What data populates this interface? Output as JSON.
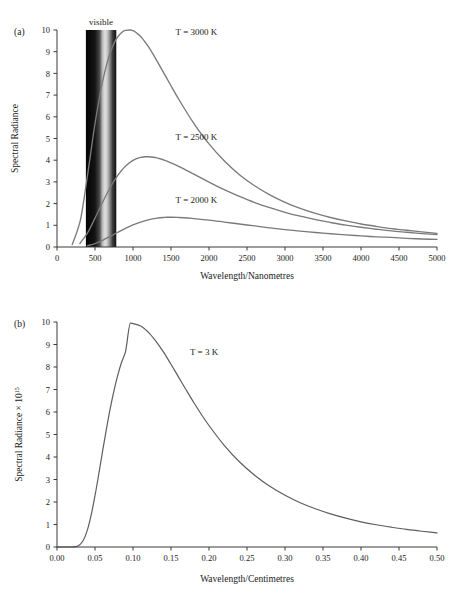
{
  "figure": {
    "panel_a_tag": "(a)",
    "panel_b_tag": "(b)"
  },
  "panel_a": {
    "xlabel": "Wavelength/Nanometres",
    "ylabel": "Spectral Radiance",
    "band_label": "visible",
    "band_range_nm": [
      380,
      780
    ],
    "xticks": [
      "0",
      "500",
      "1000",
      "1500",
      "2000",
      "2500",
      "3000",
      "3500",
      "4000",
      "4500",
      "5000"
    ],
    "yticks": [
      "0",
      "1",
      "2",
      "3",
      "4",
      "5",
      "6",
      "7",
      "8",
      "9",
      "10"
    ],
    "series_labels": [
      "T = 3000 K",
      "T = 2500 K",
      "T = 2000 K"
    ]
  },
  "panel_b": {
    "xlabel": "Wavelength/Centimetres",
    "ylabel_main": "Spectral Radiance × 10",
    "ylabel_exp": "15",
    "xticks": [
      "0.00",
      "0.05",
      "0.10",
      "0.15",
      "0.20",
      "0.25",
      "0.30",
      "0.35",
      "0.40",
      "0.45",
      "0.50"
    ],
    "yticks": [
      "0",
      "1",
      "2",
      "3",
      "4",
      "5",
      "6",
      "7",
      "8",
      "9",
      "10"
    ],
    "series_label": "T = 3 K"
  },
  "colors": {
    "curve": "#7a7a7a",
    "curve_b": "#5e5e5e",
    "axis": "#3a3a3a",
    "text": "#1a1a1a"
  },
  "chart_data": [
    {
      "type": "line",
      "title": "",
      "xlabel": "Wavelength/Nanometres",
      "ylabel": "Spectral Radiance",
      "xlim": [
        0,
        5000
      ],
      "ylim": [
        0,
        10
      ],
      "grid": false,
      "legend_position": "inline-annotations",
      "annotations": [
        {
          "text": "visible",
          "x": 580,
          "y": 10.6
        },
        {
          "text": "T = 3000 K",
          "x": 1560,
          "y": 9.75
        },
        {
          "text": "T = 2500 K",
          "x": 1560,
          "y": 4.95
        },
        {
          "text": "T = 2000 K",
          "x": 1560,
          "y": 2.05
        }
      ],
      "shaded_region": {
        "label": "visible",
        "x_start": 380,
        "x_end": 780,
        "y_start": 0,
        "y_end": 10,
        "fill": "spectrum-gradient-grayscale"
      },
      "series": [
        {
          "name": "T = 3000 K",
          "temperature_K": 3000,
          "peak_x_nm": 966,
          "peak_y": 10.0,
          "x": [
            200,
            300,
            400,
            500,
            600,
            700,
            800,
            900,
            966,
            1000,
            1100,
            1200,
            1300,
            1400,
            1500,
            1600,
            1800,
            2000,
            2200,
            2400,
            2600,
            2800,
            3000,
            3200,
            3400,
            3600,
            3800,
            4000,
            4200,
            4400,
            4600,
            4800,
            5000
          ],
          "y": [
            0.11,
            1.12,
            3.27,
            5.68,
            7.63,
            8.95,
            9.69,
            9.98,
            10.0,
            9.97,
            9.7,
            9.24,
            8.67,
            8.05,
            7.43,
            6.82,
            5.7,
            4.75,
            3.97,
            3.33,
            2.82,
            2.4,
            2.06,
            1.78,
            1.55,
            1.36,
            1.2,
            1.06,
            0.95,
            0.85,
            0.77,
            0.7,
            0.63
          ]
        },
        {
          "name": "T = 2500 K",
          "temperature_K": 2500,
          "peak_x_nm": 1159,
          "peak_y": 4.16,
          "x": [
            300,
            400,
            500,
            600,
            700,
            800,
            900,
            1000,
            1100,
            1159,
            1200,
            1300,
            1400,
            1500,
            1600,
            1800,
            2000,
            2200,
            2400,
            2600,
            2800,
            3000,
            3200,
            3400,
            3600,
            3800,
            4000,
            4200,
            4400,
            4600,
            4800,
            5000
          ],
          "y": [
            0.16,
            0.64,
            1.33,
            2.06,
            2.74,
            3.3,
            3.72,
            3.99,
            4.13,
            4.16,
            4.16,
            4.12,
            4.02,
            3.88,
            3.72,
            3.36,
            2.99,
            2.64,
            2.33,
            2.05,
            1.81,
            1.6,
            1.42,
            1.26,
            1.13,
            1.01,
            0.91,
            0.82,
            0.74,
            0.68,
            0.62,
            0.57
          ]
        },
        {
          "name": "T = 2000 K",
          "temperature_K": 2000,
          "peak_x_nm": 1449,
          "peak_y": 1.37,
          "x": [
            400,
            500,
            600,
            700,
            800,
            900,
            1000,
            1100,
            1200,
            1300,
            1400,
            1449,
            1500,
            1600,
            1800,
            2000,
            2200,
            2400,
            2600,
            2800,
            3000,
            3200,
            3400,
            3600,
            3800,
            4000,
            4200,
            4400,
            4600,
            4800,
            5000
          ],
          "y": [
            0.06,
            0.16,
            0.31,
            0.49,
            0.68,
            0.86,
            1.02,
            1.15,
            1.25,
            1.32,
            1.36,
            1.37,
            1.37,
            1.36,
            1.31,
            1.24,
            1.15,
            1.06,
            0.97,
            0.88,
            0.8,
            0.73,
            0.67,
            0.61,
            0.56,
            0.51,
            0.47,
            0.44,
            0.4,
            0.37,
            0.35
          ]
        }
      ]
    },
    {
      "type": "line",
      "title": "",
      "xlabel": "Wavelength/Centimetres",
      "ylabel": "Spectral Radiance × 10^15",
      "xlim": [
        0.0,
        0.5
      ],
      "ylim": [
        0,
        10
      ],
      "grid": false,
      "legend_position": "inline-annotation",
      "annotations": [
        {
          "text": "T = 3 K",
          "x": 0.175,
          "y": 8.55
        }
      ],
      "series": [
        {
          "name": "T = 3 K",
          "temperature_K": 3,
          "peak_x_cm": 0.0966,
          "peak_y": 9.95,
          "x": [
            0.0,
            0.01,
            0.02,
            0.025,
            0.03,
            0.035,
            0.04,
            0.045,
            0.05,
            0.055,
            0.06,
            0.065,
            0.07,
            0.075,
            0.08,
            0.085,
            0.09,
            0.0966,
            0.1,
            0.11,
            0.12,
            0.13,
            0.14,
            0.15,
            0.16,
            0.17,
            0.18,
            0.19,
            0.2,
            0.22,
            0.24,
            0.26,
            0.28,
            0.3,
            0.32,
            0.34,
            0.36,
            0.38,
            0.4,
            0.42,
            0.44,
            0.46,
            0.48,
            0.5
          ],
          "y": [
            0.0,
            0.0,
            0.0,
            0.02,
            0.1,
            0.32,
            0.76,
            1.43,
            2.28,
            3.25,
            4.26,
            5.24,
            6.15,
            6.95,
            7.64,
            8.21,
            8.66,
            9.95,
            9.93,
            9.82,
            9.55,
            9.15,
            8.67,
            8.12,
            7.55,
            6.98,
            6.42,
            5.89,
            5.4,
            4.52,
            3.79,
            3.19,
            2.7,
            2.3,
            1.97,
            1.7,
            1.47,
            1.28,
            1.12,
            0.99,
            0.88,
            0.78,
            0.7,
            0.63
          ]
        }
      ]
    }
  ]
}
